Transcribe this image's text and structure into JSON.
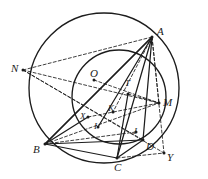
{
  "figure": {
    "kind": "geometry-diagram",
    "width": 208,
    "height": 179,
    "background_color": "#ffffff",
    "stroke_color": "#1c1c1c"
  },
  "circles": [
    {
      "name": "outer-circle",
      "cx": 104,
      "cy": 88,
      "r": 75,
      "style": "solid"
    },
    {
      "name": "inner-circle",
      "cx": 119,
      "cy": 97,
      "r": 47,
      "style": "solid"
    }
  ],
  "points": {
    "A": {
      "label": "A",
      "x": 152,
      "y": 37,
      "label_x": 157,
      "label_y": 26,
      "dot": true
    },
    "B": {
      "label": "B",
      "x": 45,
      "y": 144,
      "label_x": 33,
      "label_y": 144,
      "dot": true
    },
    "C": {
      "label": "C",
      "x": 117,
      "y": 158,
      "label_x": 114,
      "label_y": 162,
      "dot": true
    },
    "D": {
      "label": "D",
      "x": 143,
      "y": 140,
      "label_x": 146,
      "label_y": 141,
      "dot": true
    },
    "N": {
      "label": "N",
      "x": 23,
      "y": 70,
      "label_x": 11,
      "label_y": 63,
      "dot": true
    },
    "M": {
      "label": "M",
      "x": 159,
      "y": 103,
      "label_x": 163,
      "label_y": 97,
      "dot": true
    },
    "O": {
      "label": "O",
      "x": 94,
      "y": 80,
      "label_x": 90,
      "label_y": 68,
      "dot": true
    },
    "T": {
      "label": "T",
      "x": 128,
      "y": 94,
      "label_x": 125,
      "label_y": 79,
      "dot": true
    },
    "K": {
      "label": "K",
      "x": 113,
      "y": 112,
      "label_x": 108,
      "label_y": 104,
      "dot": true
    },
    "X": {
      "label": "X",
      "x": 88,
      "y": 117,
      "label_x": 80,
      "label_y": 112,
      "dot": true
    },
    "I": {
      "label": "I",
      "x": 98,
      "y": 127,
      "label_x": 94,
      "label_y": 122,
      "dot": true
    },
    "J": {
      "label": "J",
      "x": 136,
      "y": 132,
      "label_x": 133,
      "label_y": 127,
      "dot": true
    },
    "Y": {
      "label": "Y",
      "x": 164,
      "y": 153,
      "label_x": 167,
      "label_y": 152,
      "dot": true
    }
  },
  "solid_segments": [
    {
      "name": "segment-A-B",
      "from": "A",
      "to": "B"
    },
    {
      "name": "segment-A-C",
      "from": "A",
      "to": "C"
    },
    {
      "name": "segment-A-D",
      "from": "A",
      "to": "D"
    },
    {
      "name": "segment-B-C",
      "from": "B",
      "to": "C"
    },
    {
      "name": "segment-B-D",
      "from": "B",
      "to": "D"
    },
    {
      "name": "segment-B-X",
      "from": "B",
      "to": "X"
    },
    {
      "name": "segment-C-D",
      "from": "C",
      "to": "D"
    },
    {
      "name": "segment-C-T",
      "from": "C",
      "to": "T"
    },
    {
      "name": "segment-A-I",
      "from": "A",
      "to": "I"
    },
    {
      "name": "segment-B-A-upper",
      "from": "B",
      "to": "A"
    }
  ],
  "dashed_segments": [
    {
      "name": "segment-N-A",
      "from": "N",
      "to": "A"
    },
    {
      "name": "segment-N-M",
      "from": "N",
      "to": "M"
    },
    {
      "name": "segment-N-D",
      "from": "N",
      "to": "D"
    },
    {
      "name": "segment-N-Y",
      "from": "N",
      "to": "Y"
    },
    {
      "name": "segment-A-M",
      "from": "A",
      "to": "M"
    },
    {
      "name": "segment-A-Y",
      "from": "A",
      "to": "Y"
    },
    {
      "name": "segment-A-K",
      "from": "A",
      "to": "K"
    },
    {
      "name": "segment-B-M",
      "from": "B",
      "to": "M"
    },
    {
      "name": "segment-B-J",
      "from": "B",
      "to": "J"
    },
    {
      "name": "segment-X-M",
      "from": "X",
      "to": "M"
    },
    {
      "name": "segment-O-M",
      "from": "O",
      "to": "M"
    },
    {
      "name": "segment-T-M",
      "from": "T",
      "to": "M"
    },
    {
      "name": "segment-C-Y",
      "from": "C",
      "to": "Y"
    }
  ],
  "point_order": [
    "A",
    "B",
    "C",
    "D",
    "N",
    "M",
    "O",
    "T",
    "K",
    "X",
    "I",
    "J",
    "Y"
  ]
}
